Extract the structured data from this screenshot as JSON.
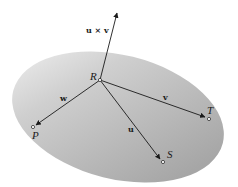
{
  "diagram": {
    "type": "vector-plane",
    "plane": {
      "fill_light": "#eeeeee",
      "fill_dark": "#a9a9a9"
    },
    "points": {
      "R": {
        "label": "R",
        "x": 100,
        "y": 80
      },
      "P": {
        "label": "P",
        "x": 33,
        "y": 127
      },
      "S": {
        "label": "S",
        "x": 162,
        "y": 162
      },
      "T": {
        "label": "T",
        "x": 208,
        "y": 119
      }
    },
    "vectors": {
      "w": {
        "label": "w",
        "from": "R",
        "to": "P"
      },
      "u": {
        "label": "u",
        "from": "R",
        "to": "S"
      },
      "v": {
        "label": "v",
        "from": "R",
        "to": "T"
      },
      "cross": {
        "label": "u × v",
        "from": "R",
        "to": "up"
      }
    }
  }
}
